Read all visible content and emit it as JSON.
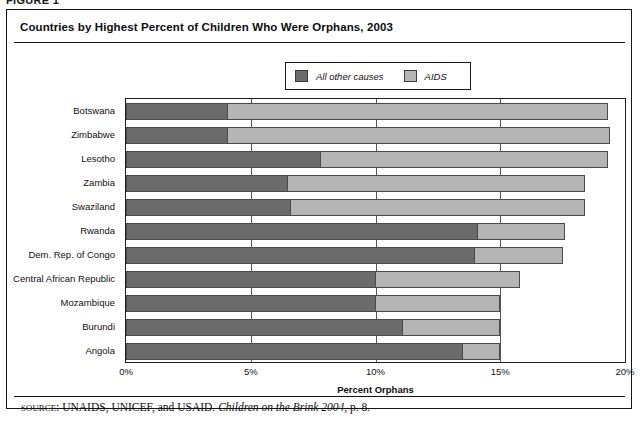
{
  "figure_strip": {
    "label": "FIGURE 1"
  },
  "chart_title": "Countries by Highest Percent of Children Who Were Orphans, 2003",
  "legend": {
    "items": [
      {
        "label": "All other causes",
        "color": "#6b6b6b",
        "icon": "legend-swatch-icon"
      },
      {
        "label": "AIDS",
        "color": "#b5b5b5",
        "icon": "legend-swatch-icon"
      }
    ]
  },
  "source_note": {
    "prefix": "SOURCE",
    "colon": ": ",
    "agencies": "UNAIDS, UNICEF, and USAID. ",
    "publication": "Children on the Brink 2004",
    "page": ", p. 8."
  },
  "chart_data": {
    "type": "bar",
    "orientation": "horizontal",
    "stacked": true,
    "title": "Countries by Highest Percent of Children Who Were Orphans, 2003",
    "xlabel": "Percent Orphans",
    "ylabel": "",
    "xlim": [
      0,
      20
    ],
    "xticks": [
      0,
      5,
      10,
      15,
      20
    ],
    "xtick_labels": [
      "0%",
      "5%",
      "10%",
      "15%",
      "20%"
    ],
    "grid": true,
    "legend_position": "top-center",
    "categories": [
      "Botswana",
      "Zimbabwe",
      "Lesotho",
      "Zambia",
      "Swaziland",
      "Rwanda",
      "Dem. Rep. of Congo",
      "Central African Republic",
      "Mozambique",
      "Burundi",
      "Angola"
    ],
    "series": [
      {
        "name": "All other causes",
        "color": "#6b6b6b",
        "values": [
          4.1,
          4.1,
          7.8,
          6.5,
          6.6,
          14.1,
          14.0,
          10.0,
          10.0,
          11.1,
          13.5
        ]
      },
      {
        "name": "AIDS",
        "color": "#b5b5b5",
        "values": [
          15.2,
          15.3,
          11.5,
          11.9,
          11.8,
          3.5,
          3.5,
          5.8,
          5.0,
          3.9,
          1.5
        ]
      }
    ],
    "totals": [
      19.3,
      19.4,
      19.3,
      18.4,
      18.4,
      17.6,
      17.5,
      15.8,
      15.0,
      15.0,
      15.0
    ]
  }
}
